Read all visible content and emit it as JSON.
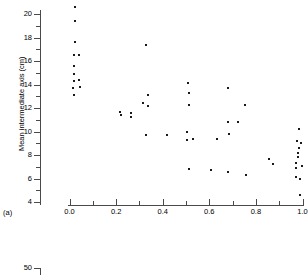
{
  "figure": {
    "panel_label_a": "(a)",
    "colors": {
      "axis": "#4a4a4a",
      "marker": "#1a1a1a",
      "background": "#ffffff"
    }
  },
  "chart_data": {
    "type": "scatter",
    "title": "",
    "xlabel": "",
    "ylabel": "Mean intermediate axis (cm)",
    "xlim": [
      0.0,
      1.0
    ],
    "ylim": [
      4,
      21
    ],
    "grid": false,
    "legend": null,
    "xticks": [
      "0.0",
      "0.2",
      "0.4",
      "0.6",
      "0.8",
      "1.0"
    ],
    "xtick_values": [
      0.0,
      0.2,
      0.4,
      0.6,
      0.8,
      1.0
    ],
    "xminor_values": [
      0.1,
      0.3,
      0.5,
      0.7,
      0.9
    ],
    "yticks": [
      "4",
      "6",
      "8",
      "10",
      "12",
      "14",
      "16",
      "18",
      "20"
    ],
    "ytick_values": [
      4,
      6,
      8,
      10,
      12,
      14,
      16,
      18,
      20
    ],
    "yminor_values": [
      5,
      7,
      9,
      11,
      13,
      15,
      17,
      19,
      21
    ],
    "points": [
      {
        "x": 0.025,
        "y": 20.6
      },
      {
        "x": 0.022,
        "y": 19.4
      },
      {
        "x": 0.022,
        "y": 17.6
      },
      {
        "x": 0.018,
        "y": 16.5
      },
      {
        "x": 0.04,
        "y": 16.5
      },
      {
        "x": 0.02,
        "y": 15.6
      },
      {
        "x": 0.02,
        "y": 14.9
      },
      {
        "x": 0.018,
        "y": 14.3
      },
      {
        "x": 0.042,
        "y": 14.4
      },
      {
        "x": 0.016,
        "y": 13.7
      },
      {
        "x": 0.046,
        "y": 13.8
      },
      {
        "x": 0.018,
        "y": 13.1
      },
      {
        "x": 0.33,
        "y": 17.4
      },
      {
        "x": 0.215,
        "y": 11.7
      },
      {
        "x": 0.222,
        "y": 11.4
      },
      {
        "x": 0.265,
        "y": 11.6
      },
      {
        "x": 0.262,
        "y": 11.2
      },
      {
        "x": 0.316,
        "y": 12.4
      },
      {
        "x": 0.338,
        "y": 13.1
      },
      {
        "x": 0.336,
        "y": 12.2
      },
      {
        "x": 0.33,
        "y": 9.7
      },
      {
        "x": 0.42,
        "y": 9.7
      },
      {
        "x": 0.508,
        "y": 14.1
      },
      {
        "x": 0.512,
        "y": 13.3
      },
      {
        "x": 0.512,
        "y": 12.3
      },
      {
        "x": 0.505,
        "y": 10.0
      },
      {
        "x": 0.506,
        "y": 9.3
      },
      {
        "x": 0.528,
        "y": 9.4
      },
      {
        "x": 0.512,
        "y": 6.8
      },
      {
        "x": 0.608,
        "y": 6.7
      },
      {
        "x": 0.632,
        "y": 9.4
      },
      {
        "x": 0.678,
        "y": 13.7
      },
      {
        "x": 0.682,
        "y": 10.8
      },
      {
        "x": 0.722,
        "y": 10.8
      },
      {
        "x": 0.684,
        "y": 9.8
      },
      {
        "x": 0.68,
        "y": 6.6
      },
      {
        "x": 0.755,
        "y": 12.3
      },
      {
        "x": 0.758,
        "y": 6.3
      },
      {
        "x": 0.858,
        "y": 7.7
      },
      {
        "x": 0.872,
        "y": 7.2
      },
      {
        "x": 0.985,
        "y": 10.2
      },
      {
        "x": 0.978,
        "y": 9.2
      },
      {
        "x": 0.992,
        "y": 9.0
      },
      {
        "x": 0.984,
        "y": 8.6
      },
      {
        "x": 0.982,
        "y": 8.2
      },
      {
        "x": 0.98,
        "y": 7.8
      },
      {
        "x": 0.972,
        "y": 7.3
      },
      {
        "x": 0.996,
        "y": 7.1
      },
      {
        "x": 0.972,
        "y": 6.9
      },
      {
        "x": 0.974,
        "y": 6.1
      },
      {
        "x": 0.988,
        "y": 6.0
      },
      {
        "x": 0.99,
        "y": 4.6
      }
    ]
  },
  "panel_b": {
    "tick_label": "50"
  }
}
